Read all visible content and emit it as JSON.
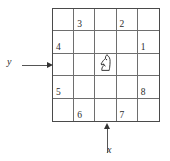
{
  "figure": {
    "type": "chessboard-diagram",
    "grid": {
      "rows": 5,
      "columns": 5,
      "border_color": "#4a4a4a",
      "line_color": "#6e6e6e"
    },
    "cells": [
      [
        {
          "label": "",
          "piece": ""
        },
        {
          "label": "3",
          "piece": ""
        },
        {
          "label": "",
          "piece": ""
        },
        {
          "label": "2",
          "piece": ""
        },
        {
          "label": "",
          "piece": ""
        }
      ],
      [
        {
          "label": "4",
          "piece": ""
        },
        {
          "label": "",
          "piece": ""
        },
        {
          "label": "",
          "piece": ""
        },
        {
          "label": "",
          "piece": ""
        },
        {
          "label": "1",
          "piece": ""
        }
      ],
      [
        {
          "label": "",
          "piece": ""
        },
        {
          "label": "",
          "piece": ""
        },
        {
          "label": "",
          "piece": "knight-icon"
        },
        {
          "label": "",
          "piece": ""
        },
        {
          "label": "",
          "piece": ""
        }
      ],
      [
        {
          "label": "5",
          "piece": ""
        },
        {
          "label": "",
          "piece": ""
        },
        {
          "label": "",
          "piece": ""
        },
        {
          "label": "",
          "piece": ""
        },
        {
          "label": "8",
          "piece": ""
        }
      ],
      [
        {
          "label": "",
          "piece": ""
        },
        {
          "label": "6",
          "piece": ""
        },
        {
          "label": "",
          "piece": ""
        },
        {
          "label": "7",
          "piece": ""
        },
        {
          "label": "",
          "piece": ""
        }
      ]
    ],
    "axes": {
      "y": {
        "label": "y",
        "icon": "arrow-right-icon",
        "points_to": "row 3"
      },
      "x": {
        "label": "x",
        "icon": "arrow-up-icon",
        "points_to": "column 3"
      }
    }
  }
}
